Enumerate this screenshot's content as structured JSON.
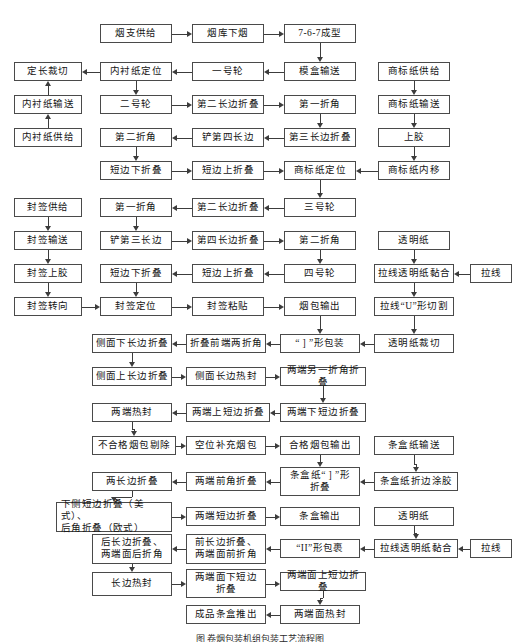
{
  "diagram": {
    "caption": "图   卷烟包装机组包装工艺流程图",
    "box_border_color": "#4a4a4a",
    "line_color": "#3c3c3c",
    "background": "#ffffff"
  },
  "nodes": [
    {
      "id": "n1",
      "label": "烟支供给",
      "x": 100,
      "y": 24,
      "w": 72,
      "h": 19
    },
    {
      "id": "n2",
      "label": "烟库下烟",
      "x": 192,
      "y": 24,
      "w": 72,
      "h": 19
    },
    {
      "id": "n3",
      "label": "7-6-7成型",
      "x": 284,
      "y": 24,
      "w": 72,
      "h": 19
    },
    {
      "id": "n4",
      "label": "定长裁切",
      "x": 14,
      "y": 62,
      "w": 68,
      "h": 19
    },
    {
      "id": "n5",
      "label": "内衬纸定位",
      "x": 100,
      "y": 62,
      "w": 72,
      "h": 19
    },
    {
      "id": "n6",
      "label": "一号轮",
      "x": 192,
      "y": 62,
      "w": 72,
      "h": 19
    },
    {
      "id": "n7",
      "label": "模盒输送",
      "x": 284,
      "y": 62,
      "w": 72,
      "h": 19
    },
    {
      "id": "n8",
      "label": "商标纸供给",
      "x": 378,
      "y": 62,
      "w": 72,
      "h": 19
    },
    {
      "id": "n9",
      "label": "内衬纸输送",
      "x": 14,
      "y": 95,
      "w": 68,
      "h": 19
    },
    {
      "id": "n10",
      "label": "二号轮",
      "x": 100,
      "y": 95,
      "w": 72,
      "h": 19
    },
    {
      "id": "n11",
      "label": "第二长边折叠",
      "x": 192,
      "y": 95,
      "w": 72,
      "h": 19
    },
    {
      "id": "n12",
      "label": "第一折角",
      "x": 284,
      "y": 95,
      "w": 72,
      "h": 19
    },
    {
      "id": "n13",
      "label": "商标纸输送",
      "x": 378,
      "y": 95,
      "w": 72,
      "h": 19
    },
    {
      "id": "n14",
      "label": "内衬纸供给",
      "x": 14,
      "y": 128,
      "w": 68,
      "h": 19
    },
    {
      "id": "n15",
      "label": "第二折角",
      "x": 100,
      "y": 128,
      "w": 72,
      "h": 19
    },
    {
      "id": "n16",
      "label": "铲第四长边",
      "x": 192,
      "y": 128,
      "w": 72,
      "h": 19
    },
    {
      "id": "n17",
      "label": "第三长边折叠",
      "x": 284,
      "y": 128,
      "w": 72,
      "h": 19
    },
    {
      "id": "n18",
      "label": "上胶",
      "x": 378,
      "y": 128,
      "w": 72,
      "h": 19
    },
    {
      "id": "n19",
      "label": "短边下折叠",
      "x": 100,
      "y": 161,
      "w": 72,
      "h": 19
    },
    {
      "id": "n20",
      "label": "短边上折叠",
      "x": 192,
      "y": 161,
      "w": 72,
      "h": 19
    },
    {
      "id": "n21",
      "label": "商标纸定位",
      "x": 284,
      "y": 161,
      "w": 72,
      "h": 19
    },
    {
      "id": "n22",
      "label": "商标纸内移",
      "x": 378,
      "y": 161,
      "w": 72,
      "h": 19
    },
    {
      "id": "n23",
      "label": "封签供给",
      "x": 14,
      "y": 198,
      "w": 68,
      "h": 19
    },
    {
      "id": "n24",
      "label": "第一折角",
      "x": 100,
      "y": 198,
      "w": 72,
      "h": 19
    },
    {
      "id": "n25",
      "label": "第二长边折叠",
      "x": 192,
      "y": 198,
      "w": 72,
      "h": 19
    },
    {
      "id": "n26",
      "label": "三号轮",
      "x": 284,
      "y": 198,
      "w": 72,
      "h": 19
    },
    {
      "id": "n27",
      "label": "封签输送",
      "x": 14,
      "y": 231,
      "w": 68,
      "h": 19
    },
    {
      "id": "n28",
      "label": "铲第三长边",
      "x": 100,
      "y": 231,
      "w": 72,
      "h": 19
    },
    {
      "id": "n29",
      "label": "第四长边折叠",
      "x": 192,
      "y": 231,
      "w": 72,
      "h": 19
    },
    {
      "id": "n30",
      "label": "第二折角",
      "x": 284,
      "y": 231,
      "w": 72,
      "h": 19
    },
    {
      "id": "n31",
      "label": "透明纸",
      "x": 378,
      "y": 231,
      "w": 72,
      "h": 19
    },
    {
      "id": "n32",
      "label": "封签上胶",
      "x": 14,
      "y": 264,
      "w": 68,
      "h": 19
    },
    {
      "id": "n33",
      "label": "短边下折叠",
      "x": 100,
      "y": 264,
      "w": 72,
      "h": 19
    },
    {
      "id": "n34",
      "label": "短边上折叠",
      "x": 192,
      "y": 264,
      "w": 72,
      "h": 19
    },
    {
      "id": "n35",
      "label": "四号轮",
      "x": 284,
      "y": 264,
      "w": 72,
      "h": 19
    },
    {
      "id": "n36",
      "label": "拉线透明纸黏合",
      "x": 374,
      "y": 264,
      "w": 80,
      "h": 19
    },
    {
      "id": "n37",
      "label": "拉线",
      "x": 470,
      "y": 264,
      "w": 42,
      "h": 19
    },
    {
      "id": "n38",
      "label": "封签转向",
      "x": 14,
      "y": 297,
      "w": 68,
      "h": 19
    },
    {
      "id": "n39",
      "label": "封签定位",
      "x": 100,
      "y": 297,
      "w": 72,
      "h": 19
    },
    {
      "id": "n40",
      "label": "封签粘贴",
      "x": 192,
      "y": 297,
      "w": 72,
      "h": 19
    },
    {
      "id": "n41",
      "label": "烟包输出",
      "x": 284,
      "y": 297,
      "w": 72,
      "h": 19
    },
    {
      "id": "n42",
      "label": "拉线“U”形切割",
      "x": 374,
      "y": 297,
      "w": 80,
      "h": 19
    },
    {
      "id": "n43",
      "label": "侧面下长边折叠",
      "x": 92,
      "y": 334,
      "w": 80,
      "h": 19
    },
    {
      "id": "n44",
      "label": "折叠前端两折角",
      "x": 186,
      "y": 334,
      "w": 80,
      "h": 19
    },
    {
      "id": "n45",
      "label": "“ ] ”形包装",
      "x": 280,
      "y": 334,
      "w": 80,
      "h": 19
    },
    {
      "id": "n46",
      "label": "透明纸裁切",
      "x": 374,
      "y": 334,
      "w": 80,
      "h": 19
    },
    {
      "id": "n47",
      "label": "侧面上长边折叠",
      "x": 92,
      "y": 367,
      "w": 80,
      "h": 19
    },
    {
      "id": "n48",
      "label": "侧面长边热封",
      "x": 186,
      "y": 367,
      "w": 80,
      "h": 19
    },
    {
      "id": "n49",
      "label": "两端另一折角折叠",
      "x": 280,
      "y": 367,
      "w": 86,
      "h": 19
    },
    {
      "id": "n50",
      "label": "两端热封",
      "x": 92,
      "y": 403,
      "w": 80,
      "h": 19
    },
    {
      "id": "n51",
      "label": "两端上短边折叠",
      "x": 186,
      "y": 403,
      "w": 84,
      "h": 19
    },
    {
      "id": "n52",
      "label": "两端下短边折叠",
      "x": 280,
      "y": 403,
      "w": 86,
      "h": 19
    },
    {
      "id": "n53",
      "label": "不合格烟包剔除",
      "x": 92,
      "y": 436,
      "w": 84,
      "h": 19
    },
    {
      "id": "n54",
      "label": "空位补充烟包",
      "x": 186,
      "y": 436,
      "w": 80,
      "h": 19
    },
    {
      "id": "n55",
      "label": "合格烟包输出",
      "x": 280,
      "y": 436,
      "w": 80,
      "h": 19
    },
    {
      "id": "n56",
      "label": "条盒纸输送",
      "x": 374,
      "y": 436,
      "w": 80,
      "h": 19
    },
    {
      "id": "n57",
      "label": "两长边折叠",
      "x": 92,
      "y": 472,
      "w": 80,
      "h": 19
    },
    {
      "id": "n58",
      "label": "两端前角折叠",
      "x": 186,
      "y": 472,
      "w": 80,
      "h": 19
    },
    {
      "id": "n59",
      "label": "条盒纸“ ] ”形\n折叠",
      "x": 280,
      "y": 467,
      "w": 80,
      "h": 29
    },
    {
      "id": "n60",
      "label": "条盒纸折边涂胶",
      "x": 374,
      "y": 472,
      "w": 84,
      "h": 19
    },
    {
      "id": "n61",
      "label": "下侧短边折叠（美式）、\n后角折叠（欧式）",
      "x": 56,
      "y": 502,
      "w": 116,
      "h": 30
    },
    {
      "id": "n62",
      "label": "两端短边折叠",
      "x": 186,
      "y": 507,
      "w": 80,
      "h": 19
    },
    {
      "id": "n63",
      "label": "条盒输出",
      "x": 280,
      "y": 507,
      "w": 80,
      "h": 19
    },
    {
      "id": "n64",
      "label": "透明纸",
      "x": 374,
      "y": 507,
      "w": 80,
      "h": 19
    },
    {
      "id": "n65",
      "label": "后长边折叠、\n两端面后折角",
      "x": 92,
      "y": 534,
      "w": 80,
      "h": 30
    },
    {
      "id": "n66",
      "label": "前长边折叠、\n两端面前折角",
      "x": 186,
      "y": 534,
      "w": 80,
      "h": 30
    },
    {
      "id": "n67",
      "label": "“II”形包裹",
      "x": 280,
      "y": 539,
      "w": 80,
      "h": 19
    },
    {
      "id": "n68",
      "label": "拉线透明纸黏合",
      "x": 374,
      "y": 539,
      "w": 84,
      "h": 19
    },
    {
      "id": "n69",
      "label": "拉线",
      "x": 470,
      "y": 539,
      "w": 42,
      "h": 19
    },
    {
      "id": "n70",
      "label": "长边热封",
      "x": 92,
      "y": 572,
      "w": 80,
      "h": 24
    },
    {
      "id": "n71",
      "label": "两端面下短边\n折叠",
      "x": 186,
      "y": 569,
      "w": 80,
      "h": 29
    },
    {
      "id": "n72",
      "label": "两端面上短边折叠",
      "x": 280,
      "y": 572,
      "w": 86,
      "h": 19
    },
    {
      "id": "n73",
      "label": "成品条盒推出",
      "x": 186,
      "y": 605,
      "w": 80,
      "h": 19
    },
    {
      "id": "n74",
      "label": "两端面热封",
      "x": 280,
      "y": 605,
      "w": 80,
      "h": 19
    }
  ],
  "edges": [
    {
      "from": "n1",
      "to": "n2",
      "dir": "right"
    },
    {
      "from": "n2",
      "to": "n3",
      "dir": "right"
    },
    {
      "from": "n3",
      "to": "n7",
      "dir": "down"
    },
    {
      "from": "n7",
      "to": "n6",
      "dir": "left"
    },
    {
      "from": "n6",
      "to": "n5",
      "dir": "left"
    },
    {
      "from": "n5",
      "to": "n4",
      "dir": "left"
    },
    {
      "from": "n14",
      "to": "n9",
      "dir": "up"
    },
    {
      "from": "n9",
      "to": "n4",
      "dir": "up"
    },
    {
      "from": "n5",
      "to": "n10",
      "dir": "down"
    },
    {
      "from": "n10",
      "to": "n11",
      "dir": "right"
    },
    {
      "from": "n11",
      "to": "n12",
      "dir": "right"
    },
    {
      "from": "n12",
      "to": "n17",
      "dir": "down"
    },
    {
      "from": "n17",
      "to": "n16",
      "dir": "left"
    },
    {
      "from": "n16",
      "to": "n15",
      "dir": "left"
    },
    {
      "from": "n15",
      "to": "n19",
      "dir": "down"
    },
    {
      "from": "n19",
      "to": "n20",
      "dir": "right"
    },
    {
      "from": "n20",
      "to": "n21",
      "dir": "right"
    },
    {
      "from": "n8",
      "to": "n13",
      "dir": "down"
    },
    {
      "from": "n13",
      "to": "n18",
      "dir": "down"
    },
    {
      "from": "n18",
      "to": "n22",
      "dir": "down"
    },
    {
      "from": "n22",
      "to": "n21",
      "dir": "left"
    },
    {
      "from": "n21",
      "to": "n26",
      "dir": "down"
    },
    {
      "from": "n26",
      "to": "n25",
      "dir": "left"
    },
    {
      "from": "n25",
      "to": "n24",
      "dir": "left"
    },
    {
      "from": "n24",
      "to": "n28",
      "dir": "down"
    },
    {
      "from": "n28",
      "to": "n29",
      "dir": "right"
    },
    {
      "from": "n29",
      "to": "n30",
      "dir": "right"
    },
    {
      "from": "n30",
      "to": "n35",
      "dir": "down"
    },
    {
      "from": "n35",
      "to": "n34",
      "dir": "left"
    },
    {
      "from": "n34",
      "to": "n33",
      "dir": "left"
    },
    {
      "from": "n33",
      "to": "n39",
      "dir": "down"
    },
    {
      "from": "n23",
      "to": "n27",
      "dir": "down"
    },
    {
      "from": "n27",
      "to": "n32",
      "dir": "down"
    },
    {
      "from": "n32",
      "to": "n38",
      "dir": "down"
    },
    {
      "from": "n38",
      "to": "n39",
      "dir": "right"
    },
    {
      "from": "n39",
      "to": "n40",
      "dir": "right"
    },
    {
      "from": "n40",
      "to": "n41",
      "dir": "right"
    },
    {
      "from": "n41",
      "to": "n45",
      "dir": "down"
    },
    {
      "from": "n31",
      "to": "n36",
      "dir": "down"
    },
    {
      "from": "n37",
      "to": "n36",
      "dir": "left"
    },
    {
      "from": "n36",
      "to": "n42",
      "dir": "down"
    },
    {
      "from": "n42",
      "to": "n46",
      "dir": "down"
    },
    {
      "from": "n46",
      "to": "n45",
      "dir": "left"
    },
    {
      "from": "n45",
      "to": "n44",
      "dir": "left"
    },
    {
      "from": "n44",
      "to": "n43",
      "dir": "left"
    },
    {
      "from": "n43",
      "to": "n47",
      "dir": "down"
    },
    {
      "from": "n47",
      "to": "n48",
      "dir": "right"
    },
    {
      "from": "n48",
      "to": "n49",
      "dir": "right"
    },
    {
      "from": "n49",
      "to": "n52",
      "dir": "down"
    },
    {
      "from": "n52",
      "to": "n51",
      "dir": "left"
    },
    {
      "from": "n51",
      "to": "n50",
      "dir": "left"
    },
    {
      "from": "n50",
      "to": "n53",
      "dir": "down"
    },
    {
      "from": "n53",
      "to": "n54",
      "dir": "right"
    },
    {
      "from": "n54",
      "to": "n55",
      "dir": "right"
    },
    {
      "from": "n55",
      "to": "n59",
      "dir": "down"
    },
    {
      "from": "n56",
      "to": "n60",
      "dir": "down"
    },
    {
      "from": "n60",
      "to": "n59",
      "dir": "left"
    },
    {
      "from": "n59",
      "to": "n58",
      "dir": "left"
    },
    {
      "from": "n58",
      "to": "n57",
      "dir": "left"
    },
    {
      "from": "n57",
      "to": "n61",
      "dir": "down"
    },
    {
      "from": "n61",
      "to": "n62",
      "dir": "right"
    },
    {
      "from": "n62",
      "to": "n63",
      "dir": "right"
    },
    {
      "from": "n64",
      "to": "n68",
      "dir": "down"
    },
    {
      "from": "n69",
      "to": "n68",
      "dir": "left"
    },
    {
      "from": "n68",
      "to": "n67",
      "dir": "left"
    },
    {
      "from": "n67",
      "to": "n66",
      "dir": "left"
    },
    {
      "from": "n66",
      "to": "n65",
      "dir": "left"
    },
    {
      "from": "n65",
      "to": "n70",
      "dir": "down"
    },
    {
      "from": "n70",
      "to": "n71",
      "dir": "right"
    },
    {
      "from": "n71",
      "to": "n72",
      "dir": "right"
    },
    {
      "from": "n72",
      "to": "n74",
      "dir": "down"
    },
    {
      "from": "n74",
      "to": "n73",
      "dir": "left"
    }
  ]
}
